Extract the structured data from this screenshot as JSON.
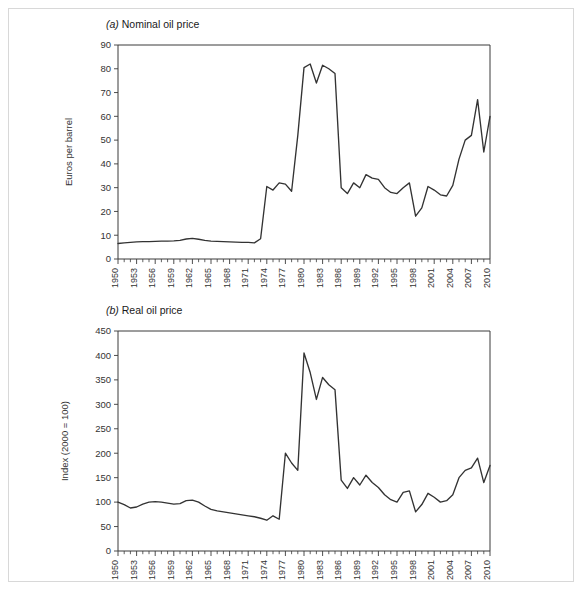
{
  "figure": {
    "panels": [
      {
        "key": "a",
        "letter": "(a)",
        "title": "Nominal oil price"
      },
      {
        "key": "b",
        "letter": "(b)",
        "title": "Real oil price"
      }
    ]
  },
  "chart_data": [
    {
      "type": "line",
      "panel_label": "(a)",
      "title": "Nominal oil price",
      "xlabel": "",
      "ylabel": "Euros per barrel",
      "xlim": [
        1950,
        2010
      ],
      "ylim": [
        0,
        90
      ],
      "ytick_values": [
        0,
        10,
        20,
        30,
        40,
        50,
        60,
        70,
        80,
        90
      ],
      "ytick_labels": [
        "0",
        "10",
        "20",
        "30",
        "40",
        "50",
        "60",
        "70",
        "80",
        "90"
      ],
      "xtick_labels": [
        "1950",
        "1953",
        "1956",
        "1959",
        "1962",
        "1965",
        "1968",
        "1971",
        "1974",
        "1977",
        "1980",
        "1983",
        "1986",
        "1989",
        "1992",
        "1995",
        "1998",
        "2001",
        "2004",
        "2007",
        "2010"
      ],
      "xtick_step_years": 3,
      "minor_tick_step_years": 1,
      "grid": false,
      "legend": "none",
      "line_color": "#333333",
      "series": [
        {
          "name": "Nominal oil price",
          "x": [
            1950,
            1951,
            1952,
            1953,
            1954,
            1955,
            1956,
            1957,
            1958,
            1959,
            1960,
            1961,
            1962,
            1963,
            1964,
            1965,
            1966,
            1967,
            1968,
            1969,
            1970,
            1971,
            1972,
            1973,
            1974,
            1975,
            1976,
            1977,
            1978,
            1979,
            1980,
            1981,
            1982,
            1983,
            1984,
            1985,
            1986,
            1987,
            1988,
            1989,
            1990,
            1991,
            1992,
            1993,
            1994,
            1995,
            1996,
            1997,
            1998,
            1999,
            2000,
            2001,
            2002,
            2003,
            2004,
            2005,
            2006,
            2007,
            2008,
            2009,
            2010
          ],
          "y": [
            6.5,
            6.8,
            7.0,
            7.2,
            7.3,
            7.3,
            7.4,
            7.5,
            7.5,
            7.6,
            7.8,
            8.4,
            8.7,
            8.3,
            7.8,
            7.5,
            7.4,
            7.3,
            7.2,
            7.1,
            7.0,
            7.0,
            6.8,
            8.5,
            30.5,
            29.0,
            32.0,
            31.5,
            28.5,
            52.0,
            80.5,
            82.0,
            74.0,
            81.5,
            80.0,
            78.0,
            30.0,
            27.5,
            32.0,
            30.0,
            35.5,
            34.0,
            33.5,
            30.0,
            28.0,
            27.5,
            30.0,
            32.0,
            18.0,
            21.5,
            30.5,
            29.0,
            27.0,
            26.5,
            31.0,
            42.0,
            50.0,
            52.0,
            67.0,
            45.0,
            60.0
          ]
        }
      ]
    },
    {
      "type": "line",
      "panel_label": "(b)",
      "title": "Real oil price",
      "xlabel": "",
      "ylabel": "Index (2000 = 100)",
      "xlim": [
        1950,
        2010
      ],
      "ylim": [
        0,
        450
      ],
      "ytick_values": [
        0,
        50,
        100,
        150,
        200,
        250,
        300,
        350,
        400,
        450
      ],
      "ytick_labels": [
        "0",
        "50",
        "100",
        "150",
        "200",
        "250",
        "300",
        "350",
        "400",
        "450"
      ],
      "xtick_labels": [
        "1950",
        "1953",
        "1956",
        "1959",
        "1962",
        "1965",
        "1968",
        "1971",
        "1974",
        "1977",
        "1980",
        "1983",
        "1986",
        "1989",
        "1992",
        "1995",
        "1998",
        "2001",
        "2004",
        "2007",
        "2010"
      ],
      "xtick_step_years": 3,
      "minor_tick_step_years": 1,
      "grid": false,
      "legend": "none",
      "line_color": "#333333",
      "series": [
        {
          "name": "Real oil price index",
          "x": [
            1950,
            1951,
            1952,
            1953,
            1954,
            1955,
            1956,
            1957,
            1958,
            1959,
            1960,
            1961,
            1962,
            1963,
            1964,
            1965,
            1966,
            1967,
            1968,
            1969,
            1970,
            1971,
            1972,
            1973,
            1974,
            1975,
            1976,
            1977,
            1978,
            1979,
            1980,
            1981,
            1982,
            1983,
            1984,
            1985,
            1986,
            1987,
            1988,
            1989,
            1990,
            1991,
            1992,
            1993,
            1994,
            1995,
            1996,
            1997,
            1998,
            1999,
            2000,
            2001,
            2002,
            2003,
            2004,
            2005,
            2006,
            2007,
            2008,
            2009,
            2010
          ],
          "y": [
            100,
            95,
            88,
            90,
            96,
            100,
            101,
            100,
            98,
            96,
            97,
            103,
            104,
            100,
            92,
            85,
            82,
            80,
            78,
            76,
            74,
            72,
            70,
            67,
            63,
            72,
            65,
            200,
            180,
            165,
            405,
            365,
            310,
            355,
            340,
            330,
            145,
            128,
            150,
            135,
            155,
            140,
            130,
            115,
            105,
            100,
            120,
            123,
            80,
            95,
            118,
            110,
            100,
            103,
            115,
            150,
            165,
            170,
            190,
            140,
            175
          ]
        }
      ]
    }
  ]
}
